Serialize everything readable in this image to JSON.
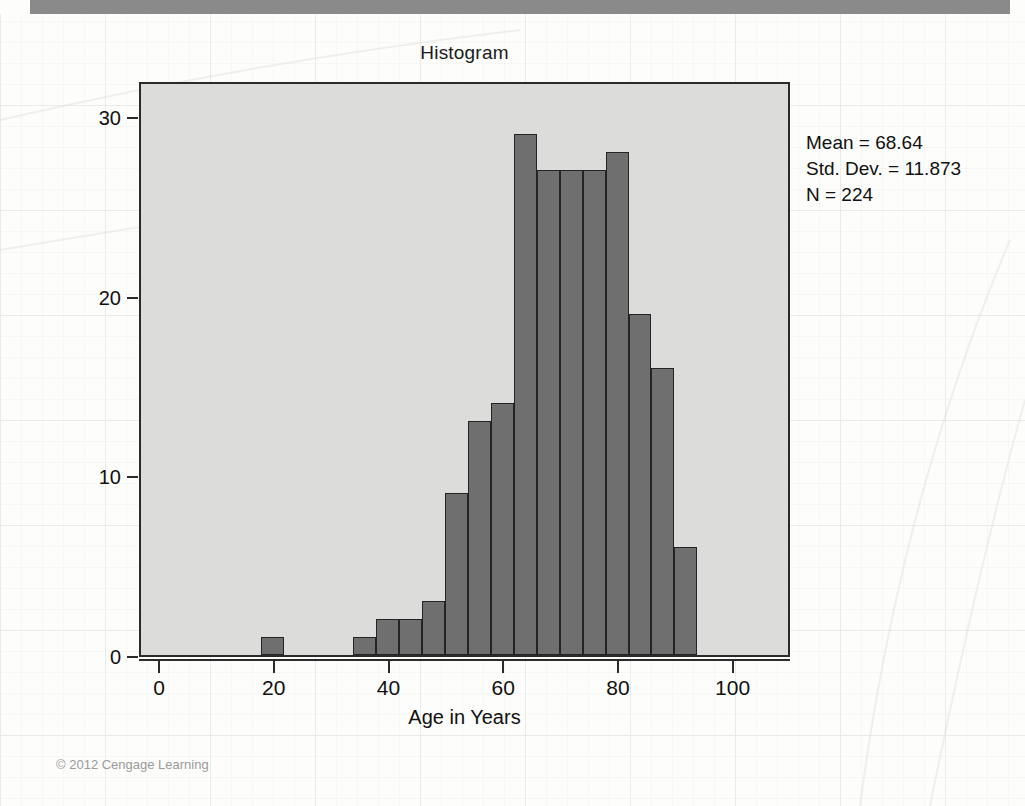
{
  "figure": {
    "title": "Histogram",
    "copyright": "© 2012 Cengage Learning"
  },
  "stats": {
    "mean_line": "Mean = 68.64",
    "std_dev_line": "Std. Dev. = 11.873",
    "n_line": "N = 224"
  },
  "colors": {
    "bar_fill": "#6f6f6f",
    "bar_edge": "#242424",
    "plot_background": "#dcdcda",
    "top_band": "#8a8a8a",
    "text": "#111111"
  },
  "chart_data": {
    "type": "bar",
    "title": "Histogram",
    "xlabel": "Age in Years",
    "ylabel": "Frequency",
    "xlim": [
      -3.5,
      110
    ],
    "ylim": [
      0,
      32
    ],
    "xticks": [
      0,
      20,
      40,
      60,
      80,
      100
    ],
    "xtick_labels": [
      "0",
      "20",
      "40",
      "60",
      "80",
      "100"
    ],
    "yticks": [
      0,
      10,
      20,
      30
    ],
    "ytick_labels": [
      "0",
      "10",
      "20",
      "30"
    ],
    "grid": false,
    "legend": false,
    "bin_width": 4,
    "annotation": "Mean = 68.64\nStd. Dev. = 11.873\nN = 224",
    "bins": [
      {
        "x0": 17.5,
        "x1": 21.5,
        "center": 19.5,
        "value": 1
      },
      {
        "x0": 33.5,
        "x1": 37.5,
        "center": 35.5,
        "value": 1
      },
      {
        "x0": 37.5,
        "x1": 41.5,
        "center": 39.5,
        "value": 2
      },
      {
        "x0": 41.5,
        "x1": 45.5,
        "center": 43.5,
        "value": 2
      },
      {
        "x0": 45.5,
        "x1": 49.5,
        "center": 47.5,
        "value": 3
      },
      {
        "x0": 49.5,
        "x1": 53.5,
        "center": 51.5,
        "value": 9
      },
      {
        "x0": 53.5,
        "x1": 57.5,
        "center": 55.5,
        "value": 13
      },
      {
        "x0": 57.5,
        "x1": 61.5,
        "center": 59.5,
        "value": 14
      },
      {
        "x0": 61.5,
        "x1": 65.5,
        "center": 63.5,
        "value": 29
      },
      {
        "x0": 65.5,
        "x1": 69.5,
        "center": 67.5,
        "value": 27
      },
      {
        "x0": 69.5,
        "x1": 73.5,
        "center": 71.5,
        "value": 27
      },
      {
        "x0": 73.5,
        "x1": 77.5,
        "center": 75.5,
        "value": 27
      },
      {
        "x0": 77.5,
        "x1": 81.5,
        "center": 79.5,
        "value": 28
      },
      {
        "x0": 81.5,
        "x1": 85.5,
        "center": 83.5,
        "value": 19
      },
      {
        "x0": 85.5,
        "x1": 89.5,
        "center": 87.5,
        "value": 16
      },
      {
        "x0": 89.5,
        "x1": 93.5,
        "center": 91.5,
        "value": 6
      }
    ],
    "categories": [
      "19.5",
      "35.5",
      "39.5",
      "43.5",
      "47.5",
      "51.5",
      "55.5",
      "59.5",
      "63.5",
      "67.5",
      "71.5",
      "75.5",
      "79.5",
      "83.5",
      "87.5",
      "91.5"
    ],
    "values": [
      1,
      1,
      2,
      2,
      3,
      9,
      13,
      14,
      29,
      27,
      27,
      27,
      28,
      19,
      16,
      6
    ]
  }
}
